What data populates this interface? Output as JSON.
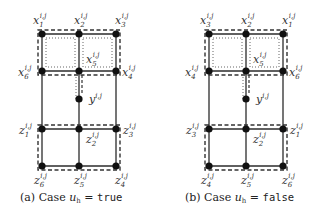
{
  "panels": [
    {
      "id": "a",
      "caption": {
        "prefix": "(a) Case ",
        "var": "u",
        "var_sub": "h",
        "eq": " = ",
        "value": "true"
      },
      "top_labels": [
        "x",
        "x",
        "x"
      ],
      "top_subs": [
        "1",
        "2",
        "3"
      ],
      "mid_left": {
        "base": "x",
        "sub": "6"
      },
      "mid_right": {
        "base": "x",
        "sub": "4"
      },
      "center_x": {
        "base": "x",
        "sub": "5"
      },
      "y_node": {
        "base": "y"
      },
      "ztop_left": {
        "base": "z",
        "sub": "1"
      },
      "ztop_right": {
        "base": "z",
        "sub": "3"
      },
      "center_z": {
        "base": "z",
        "sub": "2"
      },
      "bottom_labels": [
        "z",
        "z",
        "z"
      ],
      "bottom_subs": [
        "6",
        "5",
        "4"
      ],
      "superscript": "i,j"
    },
    {
      "id": "b",
      "caption": {
        "prefix": "(b) Case ",
        "var": "u",
        "var_sub": "h",
        "eq": " = ",
        "value": "false"
      },
      "top_labels": [
        "x",
        "x",
        "x"
      ],
      "top_subs": [
        "3",
        "2",
        "1"
      ],
      "mid_left": {
        "base": "x",
        "sub": "4"
      },
      "mid_right": {
        "base": "x",
        "sub": "6"
      },
      "center_x": {
        "base": "x",
        "sub": "5"
      },
      "y_node": {
        "base": "y"
      },
      "ztop_left": {
        "base": "z",
        "sub": "3"
      },
      "ztop_right": {
        "base": "z",
        "sub": "1"
      },
      "center_z": {
        "base": "z",
        "sub": "2"
      },
      "bottom_labels": [
        "z",
        "z",
        "z"
      ],
      "bottom_subs": [
        "4",
        "5",
        "6"
      ],
      "superscript": "i,j"
    }
  ],
  "colors": {
    "edge": "#2b2b2b",
    "node": "#111111",
    "dashed": "#333333",
    "dotted": "#555555",
    "text": "#333333"
  }
}
